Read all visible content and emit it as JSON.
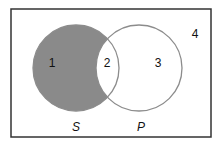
{
  "diagram": {
    "type": "venn",
    "sets": [
      {
        "name": "S",
        "label": "S",
        "shaded": true
      },
      {
        "name": "P",
        "label": "P",
        "shaded": false
      }
    ],
    "regions": [
      {
        "id": "1",
        "label": "1",
        "description": "S only",
        "shaded": true
      },
      {
        "id": "2",
        "label": "2",
        "description": "S and P",
        "shaded": false
      },
      {
        "id": "3",
        "label": "3",
        "description": "P only",
        "shaded": false
      },
      {
        "id": "4",
        "label": "4",
        "description": "outside S and P",
        "shaded": false
      }
    ],
    "colors": {
      "shade": "#8a8a8a",
      "circle_stroke": "#8c8c8c",
      "frame_stroke": "#333333",
      "background": "#ffffff"
    }
  }
}
